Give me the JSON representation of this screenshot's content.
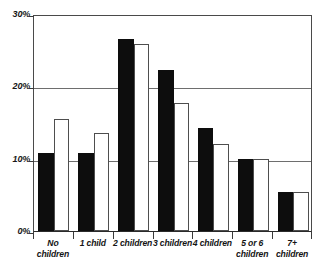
{
  "chart_data": {
    "type": "bar",
    "title": "",
    "subtitle": "",
    "xlabel": "",
    "ylabel": "",
    "categories": [
      "No\nchildren",
      "1 child",
      "2 children",
      "3 children",
      "4 children",
      "5 or 6\nchildren",
      "7+ children"
    ],
    "series": [
      {
        "name": "solid",
        "style": "filled-black",
        "color": "#0d0d0d",
        "values": [
          10.8,
          10.8,
          26.6,
          22.2,
          14.3,
          10.0,
          5.4
        ]
      },
      {
        "name": "hollow",
        "style": "outlined-white",
        "color": "#ffffff",
        "values": [
          15.5,
          13.6,
          25.8,
          17.7,
          12.0,
          10.0,
          5.4
        ]
      }
    ],
    "ylim": [
      0,
      30
    ],
    "yticks": [
      0,
      10,
      20,
      30
    ],
    "ytick_labels": [
      "0%",
      "10%",
      "20%",
      "30%"
    ],
    "grid": "horizontal",
    "legend": "none"
  },
  "axis": {
    "y_ticks": [
      {
        "label": "30%",
        "value": 30
      },
      {
        "label": "20%",
        "value": 20
      },
      {
        "label": "10%",
        "value": 10
      },
      {
        "label": "0%",
        "value": 0
      }
    ]
  },
  "colors": {
    "solid_bar": "#0d0d0d",
    "hollow_bar_fill": "#ffffff",
    "hollow_bar_stroke": "#4e4e4e",
    "gridline": "#6e6e6e",
    "frame": "#4a4a4a",
    "text": "#141414",
    "background": "#ffffff"
  }
}
